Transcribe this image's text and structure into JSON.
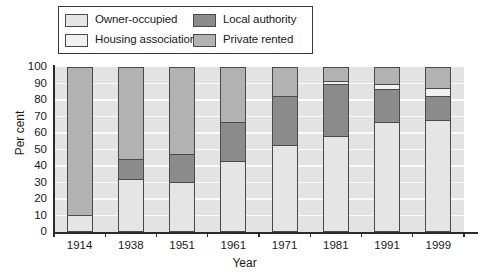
{
  "legend": {
    "items": [
      {
        "label": "Owner-occupied",
        "key": "owner_occupied",
        "color": "#e5e5e5"
      },
      {
        "label": "Local authority",
        "key": "local_authority",
        "color": "#8b8b8b"
      },
      {
        "label": "Housing association",
        "key": "housing_association",
        "color": "#f1f1f1"
      },
      {
        "label": "Private rented",
        "key": "private_rented",
        "color": "#b2b2b2"
      }
    ]
  },
  "chart_data": {
    "type": "bar",
    "subtype": "stacked-percentage",
    "title": "",
    "xlabel": "Year",
    "ylabel": "Per cent",
    "categories": [
      "1914",
      "1938",
      "1951",
      "1961",
      "1971",
      "1981",
      "1991",
      "1999"
    ],
    "ylim": [
      0,
      100
    ],
    "yticks": [
      "0",
      "10",
      "20",
      "30",
      "40",
      "50",
      "60",
      "70",
      "80",
      "90",
      "100"
    ],
    "grid": true,
    "legend_position": "top",
    "series": [
      {
        "name": "Owner-occupied",
        "color": "#e5e5e5",
        "values": [
          10,
          32,
          30,
          43,
          53,
          58,
          67,
          68
        ]
      },
      {
        "name": "Local authority",
        "color": "#8b8b8b",
        "values": [
          0,
          12,
          17,
          24,
          30,
          32,
          20,
          15
        ]
      },
      {
        "name": "Housing association",
        "color": "#f1f1f1",
        "values": [
          0,
          0,
          0,
          0,
          0,
          2,
          3,
          5
        ]
      },
      {
        "name": "Private rented",
        "color": "#b2b2b2",
        "values": [
          90,
          56,
          53,
          33,
          17,
          8,
          10,
          12
        ]
      }
    ]
  },
  "style": {
    "plot_background": "#e3e3e3",
    "gridline_color": "#fbfbfb",
    "axis_color": "#2b2b2b",
    "bar_border": "#4a4a4a"
  }
}
